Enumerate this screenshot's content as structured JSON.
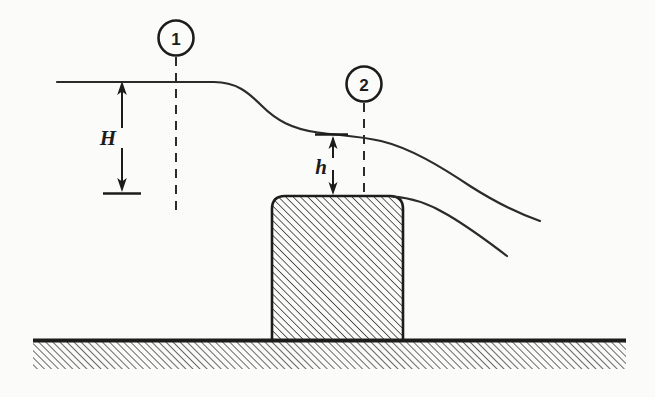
{
  "figure": {
    "type": "engineering-diagram",
    "background_color": "#fbfbf9",
    "line_color": "#1c1c1c"
  },
  "labels": {
    "station_1": "1",
    "station_2": "2",
    "head_upstream": "H",
    "head_over_crest": "h"
  },
  "elements": {
    "ground_name": "ground-hatched-band",
    "block_name": "weir-block-hatched",
    "free_surface_name": "water-free-surface-curve",
    "nappe_name": "lower-nappe-curve",
    "station_line_1_name": "station-1-dashed-line",
    "station_line_2_name": "station-2-dashed-line",
    "dimension_H_name": "dimension-arrow-H",
    "dimension_h_name": "dimension-arrow-h"
  },
  "geometry": {
    "free_surface_upstream_y": 82,
    "free_surface_start_x": 57,
    "crest_surface_y": 134,
    "block_left_x": 272,
    "block_right_x": 403,
    "block_top_y": 196,
    "block_bottom_y": 340,
    "block_corner_radius": 13,
    "ground_line_y": 340,
    "ground_left_x": 33,
    "ground_right_x": 626,
    "ground_band_height": 28,
    "station_1_x": 176,
    "station_2_x": 364,
    "H_arrow_x": 122,
    "H_top_y": 82,
    "H_bottom_y": 193,
    "h_arrow_x": 333,
    "h_top_y": 136,
    "h_bottom_y": 196,
    "hatch_angle_deg": 45,
    "hatch_spacing_px": 4
  }
}
